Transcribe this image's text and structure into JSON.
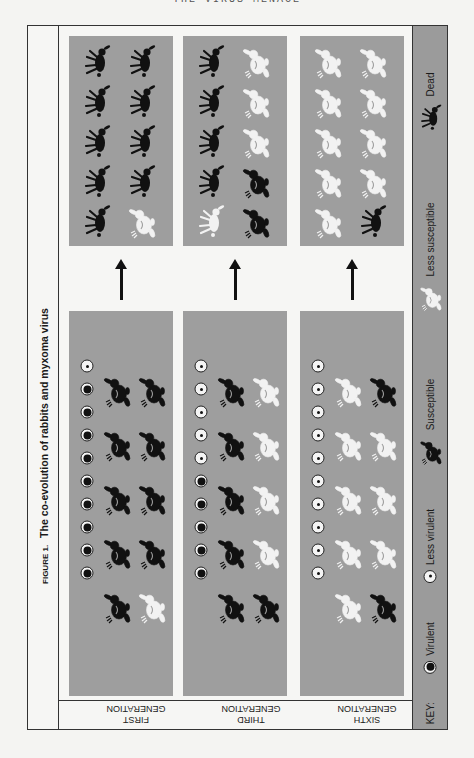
{
  "page_header": "THE VIRUS MENACE",
  "figure": {
    "number": "FIGURE 1.",
    "title": "The co-evolution of rabbits and myxoma virus"
  },
  "colors": {
    "panel_gray": "#9e9e9e",
    "key_gray": "#9b9b9b",
    "susceptible": "#111111",
    "less_susceptible": "#f2f2f2",
    "dead": "#111111"
  },
  "key": {
    "label": "KEY:",
    "items": [
      {
        "symbol": "virulent",
        "label": "Virulent"
      },
      {
        "symbol": "less_virulent",
        "label": "Less virulent"
      },
      {
        "symbol": "susceptible",
        "label": "Susceptible"
      },
      {
        "symbol": "less_susceptible",
        "label": "Less susceptible"
      },
      {
        "symbol": "dead",
        "label": "Dead"
      }
    ]
  },
  "generations": [
    {
      "label_line1": "FIRST",
      "label_line2": "GENERATION",
      "virus": [
        "less_virulent",
        "virulent",
        "virulent",
        "virulent",
        "virulent",
        "virulent",
        "virulent",
        "virulent",
        "virulent",
        "virulent"
      ],
      "before": {
        "col_a": [
          "susceptible",
          "susceptible",
          "susceptible",
          "susceptible",
          "susceptible"
        ],
        "col_b": [
          "susceptible",
          "susceptible",
          "susceptible",
          "susceptible",
          "less_susceptible"
        ]
      },
      "after": {
        "col_a": [
          "dead",
          "dead",
          "dead",
          "dead",
          "dead"
        ],
        "col_b": [
          "dead",
          "dead",
          "dead",
          "dead",
          "less_susceptible"
        ]
      }
    },
    {
      "label_line1": "THIRD",
      "label_line2": "GENERATION",
      "virus": [
        "less_virulent",
        "less_virulent",
        "less_virulent",
        "less_virulent",
        "less_virulent",
        "virulent",
        "virulent",
        "virulent",
        "virulent",
        "virulent"
      ],
      "before": {
        "col_a": [
          "susceptible",
          "susceptible",
          "susceptible",
          "susceptible",
          "susceptible"
        ],
        "col_b": [
          "less_susceptible",
          "less_susceptible",
          "less_susceptible",
          "less_susceptible",
          "susceptible"
        ]
      },
      "after": {
        "col_a": [
          "dead",
          "dead",
          "dead",
          "dead",
          "dead_less_susceptible"
        ],
        "col_b": [
          "less_susceptible",
          "less_susceptible",
          "less_susceptible",
          "susceptible",
          "susceptible"
        ]
      }
    },
    {
      "label_line1": "SIXTH",
      "label_line2": "GENERATION",
      "virus": [
        "less_virulent",
        "less_virulent",
        "less_virulent",
        "less_virulent",
        "less_virulent",
        "less_virulent",
        "less_virulent",
        "less_virulent",
        "less_virulent",
        "less_virulent"
      ],
      "before": {
        "col_a": [
          "less_susceptible",
          "less_susceptible",
          "less_susceptible",
          "less_susceptible",
          "less_susceptible"
        ],
        "col_b": [
          "susceptible",
          "less_susceptible",
          "less_susceptible",
          "less_susceptible",
          "susceptible"
        ]
      },
      "after": {
        "col_a": [
          "less_susceptible",
          "less_susceptible",
          "less_susceptible",
          "less_susceptible",
          "less_susceptible"
        ],
        "col_b": [
          "less_susceptible",
          "less_susceptible",
          "less_susceptible",
          "less_susceptible",
          "dead"
        ]
      }
    }
  ]
}
